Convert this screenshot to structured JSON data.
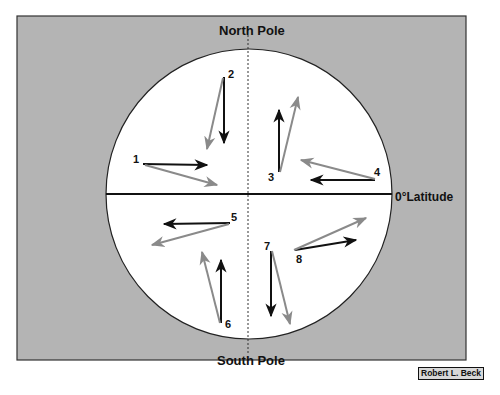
{
  "diagram": {
    "labels": {
      "north_pole": "North Pole",
      "south_pole": "South Pole",
      "equator": "0°Latitude",
      "equator_degree": "0°",
      "equator_text": "Latitude",
      "credit": "Robert L. Beck"
    },
    "colors": {
      "background_panel": "#b4b4b4",
      "globe": "#ffffff",
      "intended_path": "#111111",
      "deflected_path": "#8a8a8a",
      "outline": "#222222"
    },
    "legend_implied": {
      "black_arrow": "intended direction of motion",
      "gray_arrow": "actual deflected path"
    },
    "arrows": [
      {
        "id": "1",
        "hemisphere": "north",
        "intended": "east",
        "deflection": "right (south)"
      },
      {
        "id": "2",
        "hemisphere": "north",
        "intended": "south",
        "deflection": "right (west)"
      },
      {
        "id": "3",
        "hemisphere": "north",
        "intended": "north",
        "deflection": "right (east)"
      },
      {
        "id": "4",
        "hemisphere": "north",
        "intended": "west",
        "deflection": "right (north)"
      },
      {
        "id": "5",
        "hemisphere": "south",
        "intended": "west",
        "deflection": "left (south)"
      },
      {
        "id": "6",
        "hemisphere": "south",
        "intended": "north",
        "deflection": "left (west)"
      },
      {
        "id": "7",
        "hemisphere": "south",
        "intended": "south",
        "deflection": "left (east)"
      },
      {
        "id": "8",
        "hemisphere": "south",
        "intended": "east",
        "deflection": "left (north)"
      }
    ],
    "arrow_numbers": [
      "1",
      "2",
      "3",
      "4",
      "5",
      "6",
      "7",
      "8"
    ]
  }
}
